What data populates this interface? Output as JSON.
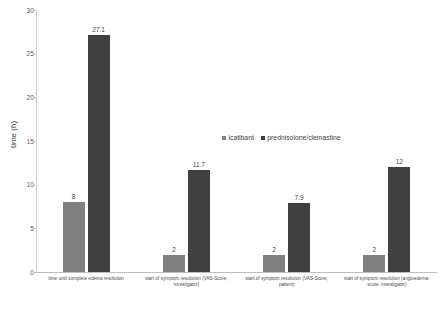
{
  "chart_data": {
    "type": "bar",
    "title": "",
    "xlabel": "",
    "ylabel": "time (h)",
    "ylim": [
      0,
      30
    ],
    "yticks": [
      "0",
      "5",
      "10",
      "15",
      "20",
      "25",
      "30"
    ],
    "grid": false,
    "legend_position": "center",
    "categories": [
      "time until complete edema resolution",
      "start of symptom resolution (VAS-Score; investigator)",
      "start of symptom resolution (VAS-Score; patient)",
      "start of symptom resolution (angioedema-score; investigator)"
    ],
    "category_lines": [
      [
        "time until complete edema resolution",
        ""
      ],
      [
        "start of symptom resolution (VAS-Score;",
        "investigator)"
      ],
      [
        "start of symptom resolution (VAS-Score;",
        "patient)"
      ],
      [
        "start of symptom resolution (angioedema-",
        "score; investigator)"
      ]
    ],
    "series": [
      {
        "name": "icatibant",
        "color": "#808080",
        "values": [
          8,
          2,
          2,
          2
        ],
        "labels": [
          "8",
          "2",
          "2",
          "2"
        ]
      },
      {
        "name": "prednisolone/clemastine",
        "color": "#404040",
        "values": [
          27.1,
          11.7,
          7.9,
          12
        ],
        "labels": [
          "27.1",
          "11.7",
          "7.9",
          "12"
        ]
      }
    ]
  },
  "legend": {
    "items": [
      {
        "label": "icatibant"
      },
      {
        "label": "prednisolone/clemastine"
      }
    ]
  },
  "axis": {
    "y_title": "time (h)"
  },
  "caption": {
    "text": ""
  }
}
